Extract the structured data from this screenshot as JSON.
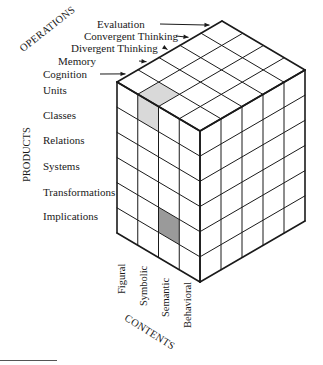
{
  "figure": {
    "axes": {
      "operations": {
        "title": "OPERATIONS",
        "items": [
          "Evaluation",
          "Convergent Thinking",
          "Divergent Thinking",
          "Memory",
          "Cognition"
        ]
      },
      "products": {
        "title": "PRODUCTS",
        "items": [
          "Units",
          "Classes",
          "Relations",
          "Systems",
          "Transformations",
          "Implications"
        ]
      },
      "contents": {
        "title": "CONTENTS",
        "items": [
          "Figural",
          "Symbolic",
          "Semantic",
          "Behavioral"
        ]
      }
    },
    "highlighted_cells": [
      {
        "content": "Symbolic",
        "product": "Units",
        "operation": "Cognition",
        "shade": "#d9d9d9"
      },
      {
        "content": "Semantic",
        "product": "Transformations",
        "operation": "Cognition",
        "shade": "#9a9a9a"
      }
    ],
    "colors": {
      "line": "#1a1a1a",
      "light_shade": "#d9d9d9",
      "dark_shade": "#9a9a9a"
    }
  }
}
